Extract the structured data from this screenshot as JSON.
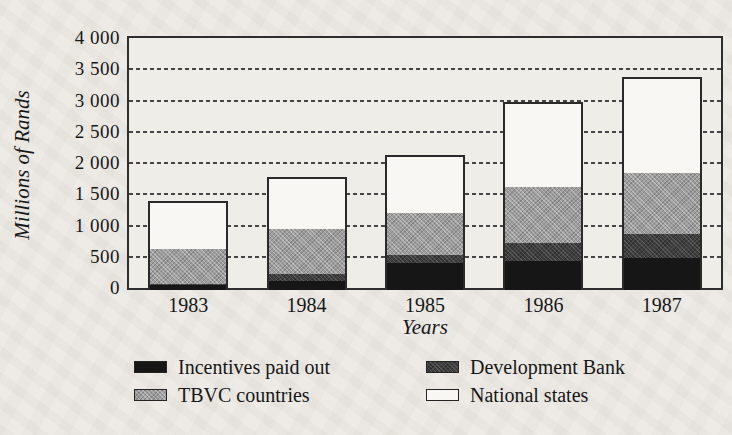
{
  "figure": {
    "background_color": "#edeae5",
    "plot_background": "#efede8",
    "frame_color": "#2e2e2e"
  },
  "chart_data": {
    "type": "bar",
    "stacked": true,
    "title": "",
    "xlabel": "Years",
    "ylabel": "Millions of Rands",
    "categories": [
      "1983",
      "1984",
      "1985",
      "1986",
      "1987"
    ],
    "series": [
      {
        "key": "incentives",
        "name": "Incentives paid out",
        "color": "#161616",
        "texture": "solid",
        "values": [
          75,
          150,
          430,
          470,
          520
        ]
      },
      {
        "key": "devbank",
        "name": "Development Bank",
        "color": "#3e3e3e",
        "texture": "speckle",
        "values": [
          25,
          110,
          130,
          280,
          380
        ]
      },
      {
        "key": "tbvc",
        "name": "TBVC countries",
        "color": "#9d9d9d",
        "texture": "dither",
        "values": [
          550,
          715,
          670,
          900,
          970
        ]
      },
      {
        "key": "national",
        "name": "National states",
        "color": "#f8f7f3",
        "texture": "plain",
        "values": [
          740,
          795,
          900,
          1330,
          1510
        ]
      }
    ],
    "totals": [
      1390,
      1770,
      2130,
      2980,
      3380
    ],
    "ylim": [
      0,
      4000
    ],
    "ytick_interval": 500,
    "ytick_labels": [
      "0",
      "500",
      "1 000",
      "1 500",
      "2 000",
      "2 500",
      "3 000",
      "3 500",
      "4 000"
    ],
    "grid": "horizontal-dashed",
    "legend_position": "bottom-two-columns"
  }
}
